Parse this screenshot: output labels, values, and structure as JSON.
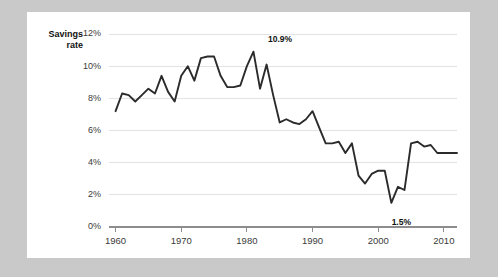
{
  "chart_data": {
    "type": "line",
    "title": "",
    "series_label": "Savings rate",
    "xlabel": "",
    "ylabel": "",
    "xlim": [
      1959,
      2012
    ],
    "ylim": [
      0,
      12
    ],
    "grid": true,
    "legend_position": "none",
    "y_ticks": [
      "0%",
      "2%",
      "4%",
      "6%",
      "8%",
      "10%",
      "12%"
    ],
    "y_tick_values": [
      0,
      2,
      4,
      6,
      8,
      10,
      12
    ],
    "x_ticks": [
      "1960",
      "1970",
      "1980",
      "1990",
      "2000",
      "2010"
    ],
    "x_tick_values": [
      1960,
      1970,
      1980,
      1990,
      2000,
      2010
    ],
    "line_color": "#2b2b2b",
    "grid_color": "#e3e3e3",
    "axis_color": "#8d8d8d",
    "x": [
      1960,
      1961,
      1962,
      1963,
      1964,
      1965,
      1966,
      1967,
      1968,
      1969,
      1970,
      1971,
      1972,
      1973,
      1974,
      1975,
      1976,
      1977,
      1978,
      1979,
      1980,
      1981,
      1982,
      1983,
      1984,
      1985,
      1986,
      1987,
      1988,
      1989,
      1990,
      1991,
      1992,
      1993,
      1994,
      1995,
      1996,
      1997,
      1998,
      1999,
      2000,
      2001,
      2002,
      2003,
      2004,
      2005,
      2006,
      2007,
      2008,
      2009,
      2010,
      2011,
      2012
    ],
    "values": [
      7.2,
      8.3,
      8.2,
      7.8,
      8.2,
      8.6,
      8.3,
      9.4,
      8.4,
      7.8,
      9.4,
      10.0,
      9.1,
      10.5,
      10.6,
      10.6,
      9.4,
      8.7,
      8.7,
      8.8,
      10.0,
      10.9,
      8.6,
      10.1,
      8.2,
      6.5,
      6.7,
      6.5,
      6.4,
      6.7,
      7.2,
      6.2,
      5.2,
      5.2,
      5.3,
      4.6,
      5.2,
      3.2,
      2.7,
      3.3,
      3.5,
      3.5,
      1.5,
      2.5,
      2.3,
      5.2,
      5.3,
      5.0,
      5.1,
      4.6,
      4.6,
      4.6,
      4.6
    ],
    "annotations": [
      {
        "name": "peak-1982",
        "text": "10.9%",
        "x": 1982,
        "y": 10.9
      },
      {
        "name": "trough-2002",
        "text": "1.5%",
        "x": 2002,
        "y": 1.5
      }
    ]
  }
}
